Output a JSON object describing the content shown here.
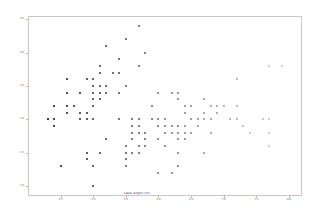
{
  "figure": {
    "background": "#ffffff",
    "width": 323,
    "height": 221
  },
  "chart_data": {
    "type": "scatter",
    "title": "",
    "xlabel": "sepal length (cm)",
    "ylabel": "sepal width (cm)",
    "xlim": [
      4.0,
      8.2
    ],
    "ylim": [
      1.85,
      4.55
    ],
    "xticks": [
      4.5,
      5.0,
      5.5,
      6.0,
      6.5,
      7.0,
      7.5,
      8.0
    ],
    "yticks": [
      2.0,
      2.5,
      3.0,
      3.5,
      4.0,
      4.5
    ],
    "xticklabels": [
      "4.5",
      "5.0",
      "5.5",
      "6.0",
      "6.5",
      "7.0",
      "7.5",
      "8.0"
    ],
    "yticklabels": [
      "2.0",
      "2.5",
      "3.0",
      "3.5",
      "4.0",
      "4.5"
    ],
    "grid": false,
    "legend": false,
    "marker": "square",
    "marker_size": 2,
    "colormap": "grayscale-by-x",
    "color_dark": "#303030",
    "color_light": "#e2e2e2",
    "spine_color": "#c9c9c9",
    "tick_color": "#b6b6b6",
    "label_color": "#5a5a5a",
    "n_points": 150,
    "points": [
      [
        5.1,
        3.5
      ],
      [
        4.9,
        3.0
      ],
      [
        4.7,
        3.2
      ],
      [
        4.6,
        3.1
      ],
      [
        5.0,
        3.6
      ],
      [
        5.4,
        3.9
      ],
      [
        4.6,
        3.4
      ],
      [
        5.0,
        3.4
      ],
      [
        4.4,
        2.9
      ],
      [
        4.9,
        3.1
      ],
      [
        5.4,
        3.7
      ],
      [
        4.8,
        3.4
      ],
      [
        4.8,
        3.0
      ],
      [
        4.3,
        3.0
      ],
      [
        5.8,
        4.0
      ],
      [
        5.7,
        4.4
      ],
      [
        5.4,
        3.9
      ],
      [
        5.1,
        3.5
      ],
      [
        5.7,
        3.8
      ],
      [
        5.1,
        3.8
      ],
      [
        5.4,
        3.4
      ],
      [
        5.1,
        3.7
      ],
      [
        4.6,
        3.6
      ],
      [
        5.1,
        3.3
      ],
      [
        4.8,
        3.4
      ],
      [
        5.0,
        3.0
      ],
      [
        5.0,
        3.4
      ],
      [
        5.2,
        3.5
      ],
      [
        5.2,
        3.4
      ],
      [
        4.7,
        3.2
      ],
      [
        4.8,
        3.1
      ],
      [
        5.4,
        3.4
      ],
      [
        5.2,
        4.1
      ],
      [
        5.5,
        4.2
      ],
      [
        4.9,
        3.1
      ],
      [
        5.0,
        3.2
      ],
      [
        5.5,
        3.5
      ],
      [
        4.9,
        3.6
      ],
      [
        4.4,
        3.0
      ],
      [
        5.1,
        3.4
      ],
      [
        5.0,
        3.5
      ],
      [
        4.5,
        2.3
      ],
      [
        4.4,
        3.2
      ],
      [
        5.0,
        3.5
      ],
      [
        5.1,
        3.8
      ],
      [
        4.8,
        3.0
      ],
      [
        5.1,
        3.8
      ],
      [
        4.6,
        3.2
      ],
      [
        5.3,
        3.7
      ],
      [
        5.0,
        3.3
      ],
      [
        7.0,
        3.2
      ],
      [
        6.4,
        3.2
      ],
      [
        6.9,
        3.1
      ],
      [
        5.5,
        2.3
      ],
      [
        6.5,
        2.8
      ],
      [
        5.7,
        2.8
      ],
      [
        6.3,
        3.3
      ],
      [
        4.9,
        2.4
      ],
      [
        6.6,
        2.9
      ],
      [
        5.2,
        2.7
      ],
      [
        5.0,
        2.0
      ],
      [
        5.9,
        3.0
      ],
      [
        6.0,
        2.2
      ],
      [
        6.1,
        2.9
      ],
      [
        5.6,
        2.9
      ],
      [
        6.7,
        3.1
      ],
      [
        5.6,
        3.0
      ],
      [
        5.8,
        2.7
      ],
      [
        6.2,
        2.2
      ],
      [
        5.6,
        2.5
      ],
      [
        5.9,
        3.2
      ],
      [
        6.1,
        2.8
      ],
      [
        6.3,
        2.5
      ],
      [
        6.1,
        2.8
      ],
      [
        6.4,
        2.9
      ],
      [
        6.6,
        3.0
      ],
      [
        6.8,
        2.8
      ],
      [
        6.7,
        3.0
      ],
      [
        6.0,
        2.9
      ],
      [
        5.7,
        2.6
      ],
      [
        5.5,
        2.4
      ],
      [
        5.5,
        2.4
      ],
      [
        5.8,
        2.7
      ],
      [
        6.0,
        2.7
      ],
      [
        5.4,
        3.0
      ],
      [
        6.0,
        3.4
      ],
      [
        6.7,
        3.1
      ],
      [
        6.3,
        2.3
      ],
      [
        5.6,
        3.0
      ],
      [
        5.5,
        2.5
      ],
      [
        5.5,
        2.6
      ],
      [
        6.1,
        3.0
      ],
      [
        5.8,
        2.6
      ],
      [
        5.0,
        2.3
      ],
      [
        5.6,
        2.7
      ],
      [
        5.7,
        3.0
      ],
      [
        5.7,
        2.9
      ],
      [
        6.2,
        2.9
      ],
      [
        5.1,
        2.5
      ],
      [
        5.7,
        2.8
      ],
      [
        6.3,
        3.3
      ],
      [
        5.8,
        2.7
      ],
      [
        7.1,
        3.0
      ],
      [
        6.3,
        2.9
      ],
      [
        6.5,
        3.0
      ],
      [
        7.6,
        3.0
      ],
      [
        4.9,
        2.5
      ],
      [
        7.3,
        2.9
      ],
      [
        6.7,
        2.5
      ],
      [
        7.2,
        3.6
      ],
      [
        6.5,
        3.2
      ],
      [
        6.4,
        2.7
      ],
      [
        6.8,
        3.0
      ],
      [
        5.7,
        2.5
      ],
      [
        5.8,
        2.8
      ],
      [
        6.4,
        3.2
      ],
      [
        6.5,
        3.0
      ],
      [
        7.7,
        3.8
      ],
      [
        7.7,
        2.6
      ],
      [
        6.0,
        2.2
      ],
      [
        6.9,
        3.2
      ],
      [
        5.6,
        2.8
      ],
      [
        7.7,
        2.8
      ],
      [
        6.3,
        2.7
      ],
      [
        6.7,
        3.3
      ],
      [
        7.2,
        3.2
      ],
      [
        6.2,
        2.8
      ],
      [
        6.1,
        3.0
      ],
      [
        6.4,
        2.8
      ],
      [
        7.2,
        3.0
      ],
      [
        7.4,
        2.8
      ],
      [
        7.9,
        3.8
      ],
      [
        6.4,
        2.8
      ],
      [
        6.3,
        2.8
      ],
      [
        6.1,
        2.6
      ],
      [
        7.7,
        3.0
      ],
      [
        6.3,
        3.4
      ],
      [
        6.4,
        3.1
      ],
      [
        6.0,
        3.0
      ],
      [
        6.9,
        3.1
      ],
      [
        6.7,
        3.1
      ],
      [
        6.9,
        3.1
      ],
      [
        5.8,
        2.7
      ],
      [
        6.8,
        3.2
      ],
      [
        6.7,
        3.3
      ],
      [
        6.7,
        3.0
      ],
      [
        6.3,
        2.5
      ],
      [
        6.5,
        3.0
      ],
      [
        6.2,
        3.4
      ],
      [
        5.9,
        3.0
      ]
    ]
  }
}
